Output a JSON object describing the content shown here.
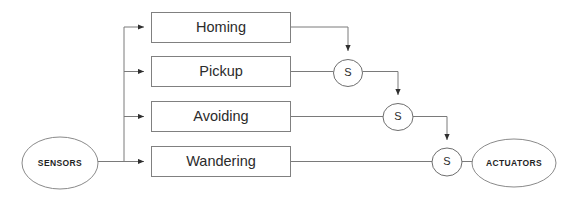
{
  "diagram": {
    "type": "subsumption-architecture-block-diagram",
    "canvas": {
      "width": 563,
      "height": 198,
      "background": "#ffffff"
    },
    "colors": {
      "stroke": "#7a7a7a",
      "box_stroke": "#808080",
      "text": "#2b2b2b",
      "background": "#ffffff"
    },
    "input_terminal": {
      "label": "SENSORS",
      "shape": "ellipse",
      "cx": 60,
      "cy": 163,
      "rx": 38,
      "ry": 26
    },
    "output_terminal": {
      "label": "ACTUATORS",
      "shape": "ellipse",
      "cx": 514,
      "cy": 163,
      "rx": 42,
      "ry": 24
    },
    "behavior_layers": [
      {
        "label": "Homing",
        "x": 151,
        "y": 12,
        "w": 140,
        "h": 31
      },
      {
        "label": "Pickup",
        "x": 151,
        "y": 56,
        "w": 140,
        "h": 31
      },
      {
        "label": "Avoiding",
        "x": 151,
        "y": 101,
        "w": 140,
        "h": 31
      },
      {
        "label": "Wandering",
        "x": 151,
        "y": 146,
        "w": 140,
        "h": 31
      }
    ],
    "suppressor_nodes": [
      {
        "label": "S",
        "cx": 348,
        "cy": 73,
        "r": 14.5
      },
      {
        "label": "S",
        "cx": 398,
        "cy": 117,
        "r": 15
      },
      {
        "label": "S",
        "cx": 447,
        "cy": 162,
        "r": 15
      }
    ],
    "bus": {
      "x": 124,
      "top": 27,
      "bottom": 161
    }
  }
}
